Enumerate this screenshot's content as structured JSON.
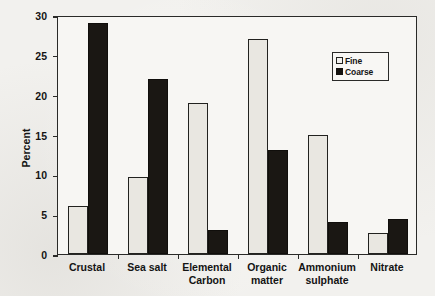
{
  "chart_data": {
    "type": "bar",
    "title": "",
    "xlabel": "",
    "ylabel": "Percent",
    "ylim": [
      0,
      30
    ],
    "yticks": [
      0,
      5,
      10,
      15,
      20,
      25,
      30
    ],
    "ytick_labels": [
      "0",
      "5",
      "10",
      "15",
      "20",
      "25",
      "30"
    ],
    "grid": false,
    "legend_position": "upper-right",
    "categories": [
      "Crustal",
      "Sea salt",
      "Elemental\nCarbon",
      "Organic\nmatter",
      "Ammonium\nsulphate",
      "Nitrate"
    ],
    "series": [
      {
        "name": "Fine",
        "color": "#e9e7e1",
        "values": [
          6,
          9.7,
          19,
          27,
          15,
          2.7
        ]
      },
      {
        "name": "Coarse",
        "color": "#1a1713",
        "values": [
          29,
          22,
          3,
          13,
          4,
          4.4
        ]
      }
    ]
  },
  "legend": {
    "items": [
      {
        "label": "Fine",
        "swatch": "hollow-square"
      },
      {
        "label": "Coarse",
        "swatch": "filled-square"
      }
    ]
  },
  "colors": {
    "background": "#f2f1ee",
    "plot_background": "#f7f6f3",
    "axis": "#2a2a28",
    "text": "#141414",
    "fine_bar": "#e9e7e1",
    "coarse_bar": "#1a1713"
  }
}
